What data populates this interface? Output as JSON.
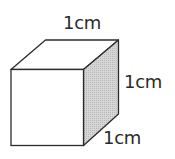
{
  "diagram": {
    "type": "cube",
    "labels": {
      "top_edge": "1cm",
      "right_edge": "1cm",
      "depth_edge": "1cm"
    },
    "colors": {
      "stroke": "#2b2b2b",
      "front_fill": "#ffffff",
      "top_fill": "#ffffff",
      "side_fill": "#cfcfcf"
    }
  }
}
